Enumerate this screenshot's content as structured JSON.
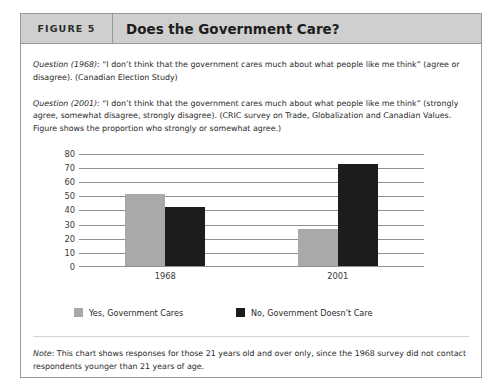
{
  "figure": {
    "tag": "FIGURE 5",
    "title": "Does the Government Care?"
  },
  "questions": [
    {
      "label": "Question (1968)",
      "text": ": “I don’t think that the government cares much about what people like me think” (agree or disagree). (Canadian Election Study)"
    },
    {
      "label": "Question (2001)",
      "text": ": “I don’t think that the government cares much about what people like me think” (strongly agree, somewhat disagree, strongly disagree). (CRIC survey on Trade, Globalization and Canadian Values. Figure shows the proportion who strongly or somewhat agree.)"
    }
  ],
  "note": {
    "label": "Note",
    "text": ": This chart shows responses for those 21 years old and over only, since the 1968 survey did not contact respondents younger than 21 years of age."
  },
  "colors": {
    "gray_series": "#a9a9a9",
    "black_series": "#1c1c1c",
    "header_band": "#cfcfcf",
    "border": "#9a9a9a",
    "gridline": "#8f8f8f"
  },
  "chart_data": {
    "type": "bar",
    "title": "Does the Government Care?",
    "xlabel": "",
    "ylabel": "",
    "categories": [
      "1968",
      "2001"
    ],
    "series": [
      {
        "name": "Yes, Government Cares",
        "color": "#a9a9a9",
        "values": [
          51,
          26
        ]
      },
      {
        "name": "No, Government Doesn't Care",
        "color": "#1c1c1c",
        "values": [
          42,
          72
        ]
      }
    ],
    "ylim": [
      0,
      80
    ],
    "yticks": [
      0,
      10,
      20,
      30,
      40,
      50,
      60,
      70,
      80
    ],
    "ytick_labels": [
      "0",
      "10",
      "20",
      "30",
      "40",
      "50",
      "60",
      "70",
      "80"
    ],
    "grid": true,
    "legend_position": "bottom"
  }
}
